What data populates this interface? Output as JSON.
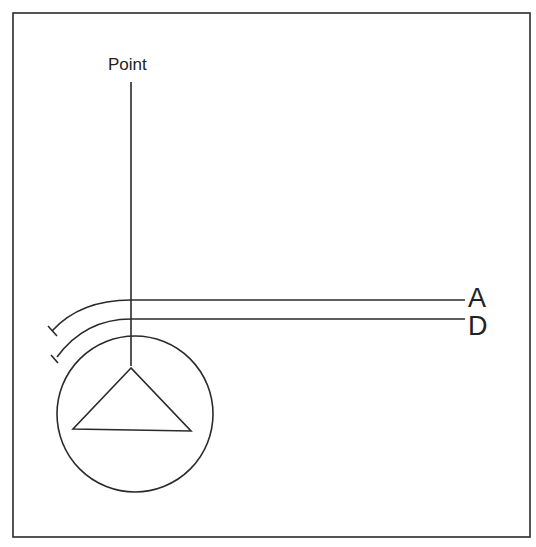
{
  "diagram": {
    "labels": {
      "point": "Point",
      "a": "A",
      "d": "D"
    },
    "colors": {
      "stroke": "#2a2a2a",
      "background": "#ffffff"
    },
    "elements": [
      {
        "type": "frame",
        "description": "rectangular border"
      },
      {
        "type": "vertical-line",
        "label": "Point"
      },
      {
        "type": "curved-line",
        "label": "A",
        "end": "tick mark at left"
      },
      {
        "type": "curved-line",
        "label": "D",
        "end": "tick mark at left"
      },
      {
        "type": "circle",
        "contains": "triangle"
      },
      {
        "type": "triangle"
      }
    ]
  }
}
